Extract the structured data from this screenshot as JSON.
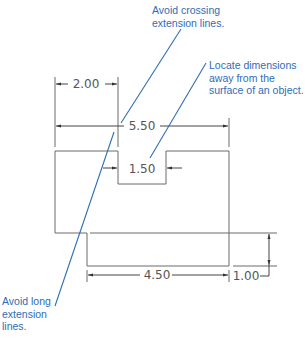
{
  "colors": {
    "object_line": "#6b6b6b",
    "dimension_line": "#444444",
    "callout": "#2f6db5",
    "background": "#ffffff"
  },
  "dimensions": {
    "notch_offset": "2.00",
    "overall_width": "5.50",
    "notch_width": "1.50",
    "lower_width": "4.50",
    "step_height": "1.00"
  },
  "notes": {
    "crossing": {
      "line1": "Avoid crossing",
      "line2": "extension lines."
    },
    "locate": {
      "line1": "Locate dimensions",
      "line2": "away from the",
      "line3": "surface of an object."
    },
    "long": {
      "line1": "Avoid long",
      "line2": "extension",
      "line3": "lines."
    }
  }
}
